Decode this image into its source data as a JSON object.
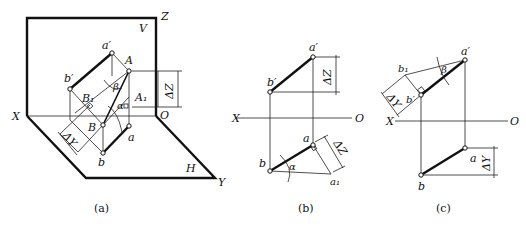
{
  "figures": [
    {
      "id": "a",
      "caption": "(a)",
      "labels": {
        "Z": "Z",
        "V": "V",
        "X": "X",
        "O": "O",
        "H": "H",
        "Y": "Y",
        "a_prime": "a′",
        "b_prime": "b′",
        "A": "A",
        "A1": "A₁",
        "B": "B",
        "B1": "B₁",
        "a": "a",
        "b": "b",
        "beta": "β",
        "alpha": "α",
        "dZ": "ΔZ",
        "dY": "ΔY"
      }
    },
    {
      "id": "b",
      "caption": "(b)",
      "labels": {
        "X": "X",
        "O": "O",
        "a_prime": "a′",
        "b_prime": "b′",
        "a": "a",
        "b": "b",
        "a1": "a₁",
        "alpha": "α",
        "dZ_top": "ΔZ",
        "dZ_side": "ΔZ"
      }
    },
    {
      "id": "c",
      "caption": "(c)",
      "labels": {
        "X": "X",
        "O": "O",
        "a_prime": "a′",
        "b_prime": "b′",
        "b1": "b₁",
        "a": "a",
        "b": "b",
        "beta": "β",
        "dY_side": "ΔY",
        "dY_bottom": "ΔY"
      }
    }
  ]
}
